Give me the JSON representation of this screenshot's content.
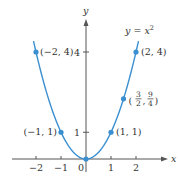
{
  "chart_data": {
    "type": "line",
    "title": "",
    "function_label": "y = x²",
    "function_label_parts": {
      "lhs": "y",
      "eq": " = ",
      "base": "x",
      "exp": "2"
    },
    "xlabel": "x",
    "ylabel": "y",
    "xlim": [
      -2.25,
      2.6
    ],
    "ylim": [
      -0.3,
      5.2
    ],
    "x_ticks": [
      -2,
      -1,
      0,
      1,
      2
    ],
    "x_tick_labels": [
      "−2",
      "−1",
      "0",
      "1",
      "2"
    ],
    "y_ticks": [
      1,
      4
    ],
    "y_tick_labels": [
      "1",
      "4"
    ],
    "curve": {
      "expression": "x^2",
      "domain": [
        -2.1,
        2.1
      ]
    },
    "points": [
      {
        "x": -2,
        "y": 4,
        "label": "(−2, 4)"
      },
      {
        "x": -1,
        "y": 1,
        "label": "(−1, 1)"
      },
      {
        "x": 0,
        "y": 0,
        "label": ""
      },
      {
        "x": 1,
        "y": 1,
        "label": "(1, 1)"
      },
      {
        "x": 1.5,
        "y": 2.25,
        "label": "(3/2, 9/4)",
        "label_frac": {
          "x_num": "3",
          "x_den": "2",
          "y_num": "9",
          "y_den": "4"
        }
      },
      {
        "x": 2,
        "y": 4,
        "label": "(2, 4)"
      }
    ],
    "grid": false,
    "colors": {
      "curve": "#3a8fd0",
      "axis": "#555555",
      "text": "#333333"
    }
  }
}
